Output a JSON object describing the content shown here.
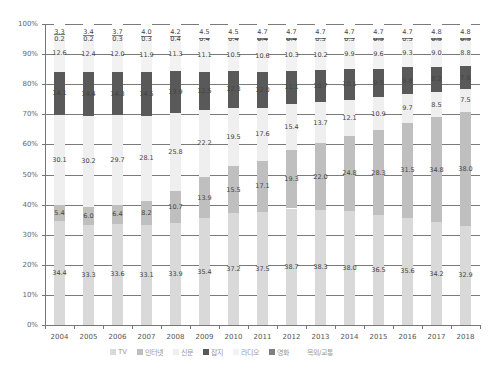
{
  "chart_data": {
    "type": "bar",
    "stacked": true,
    "percent": true,
    "title": "",
    "xlabel": "",
    "ylabel": "",
    "ylim": [
      0,
      100
    ],
    "y_ticks": [
      "0%",
      "10%",
      "20%",
      "30%",
      "40%",
      "50%",
      "60%",
      "70%",
      "80%",
      "90%",
      "100%"
    ],
    "grid": true,
    "legend_position": "bottom",
    "categories": [
      "2004",
      "2005",
      "2006",
      "2007",
      "2008",
      "2009",
      "2010",
      "2011",
      "2012",
      "2013",
      "2014",
      "2015",
      "2016",
      "2017",
      "2018"
    ],
    "series": [
      {
        "name": "TV",
        "color": "#d9d9d9",
        "values": [
          34.4,
          33.3,
          33.6,
          33.1,
          33.9,
          35.4,
          37.2,
          37.5,
          38.7,
          38.3,
          38.0,
          36.5,
          35.6,
          34.2,
          32.9
        ]
      },
      {
        "name": "인터넷",
        "color": "#bfbfbf",
        "values": [
          5.4,
          6.0,
          6.4,
          8.2,
          10.7,
          13.9,
          15.5,
          17.1,
          19.3,
          22.0,
          24.8,
          28.3,
          31.5,
          34.8,
          38.0
        ]
      },
      {
        "name": "신문",
        "color": "#efefef",
        "values": [
          30.1,
          30.2,
          29.7,
          28.1,
          25.8,
          22.2,
          19.5,
          17.6,
          15.4,
          13.7,
          12.1,
          10.9,
          9.7,
          8.5,
          7.5
        ]
      },
      {
        "name": "잡지",
        "color": "#595959",
        "values": [
          14.1,
          14.4,
          14.3,
          14.5,
          13.9,
          12.5,
          12.3,
          12.0,
          11.1,
          10.7,
          10.1,
          9.5,
          8.8,
          8.2,
          7.6
        ]
      },
      {
        "name": "라디오",
        "color": "#f2f2f2",
        "values": [
          12.6,
          12.4,
          12.0,
          11.9,
          11.3,
          11.1,
          10.5,
          10.6,
          10.3,
          10.2,
          9.9,
          9.6,
          9.3,
          9.0,
          8.8
        ]
      },
      {
        "name": "영화",
        "color": "#808080",
        "values": [
          0.2,
          0.2,
          0.3,
          0.3,
          0.4,
          0.4,
          0.4,
          0.4,
          0.4,
          0.5,
          0.5,
          0.5,
          0.5,
          0.5,
          0.5
        ]
      },
      {
        "name": "옥외/교통",
        "color": "#ffffff",
        "values": [
          3.3,
          3.4,
          3.7,
          4.0,
          4.2,
          4.5,
          4.5,
          4.7,
          4.7,
          4.7,
          4.7,
          4.7,
          4.7,
          4.8,
          4.8
        ]
      }
    ]
  }
}
